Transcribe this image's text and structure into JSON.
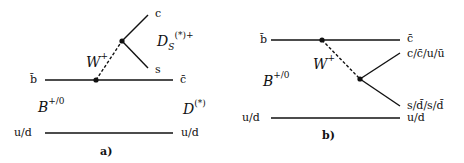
{
  "diagram_a": {
    "caption": "a)",
    "quark_top_left": "b̄",
    "quark_top_right": "c̄",
    "quark_bottom_left": "u/d",
    "quark_bottom_right": "u/d",
    "boson": "W",
    "boson_charge": "+",
    "out_upper": "c",
    "out_lower": "s",
    "meson_initial": "B",
    "meson_initial_charge": "+/0",
    "meson_final": "D",
    "meson_final_sup": "(*)",
    "meson_emitted": "D",
    "meson_emitted_sub": "S",
    "meson_emitted_sup": "(*)+"
  },
  "diagram_b": {
    "caption": "b)",
    "quark_top_left": "b̄",
    "quark_top_right": "c̄",
    "out_upper": "c/c̄/u/ū",
    "out_lower": "s/d̄/s/d̄",
    "quark_bottom_left": "u/d",
    "quark_bottom_right": "u/d",
    "boson": "W",
    "boson_charge": "+",
    "meson_initial": "B",
    "meson_initial_charge": "+/0"
  },
  "colors": {
    "line": "#111111",
    "background": "#ffffff"
  }
}
